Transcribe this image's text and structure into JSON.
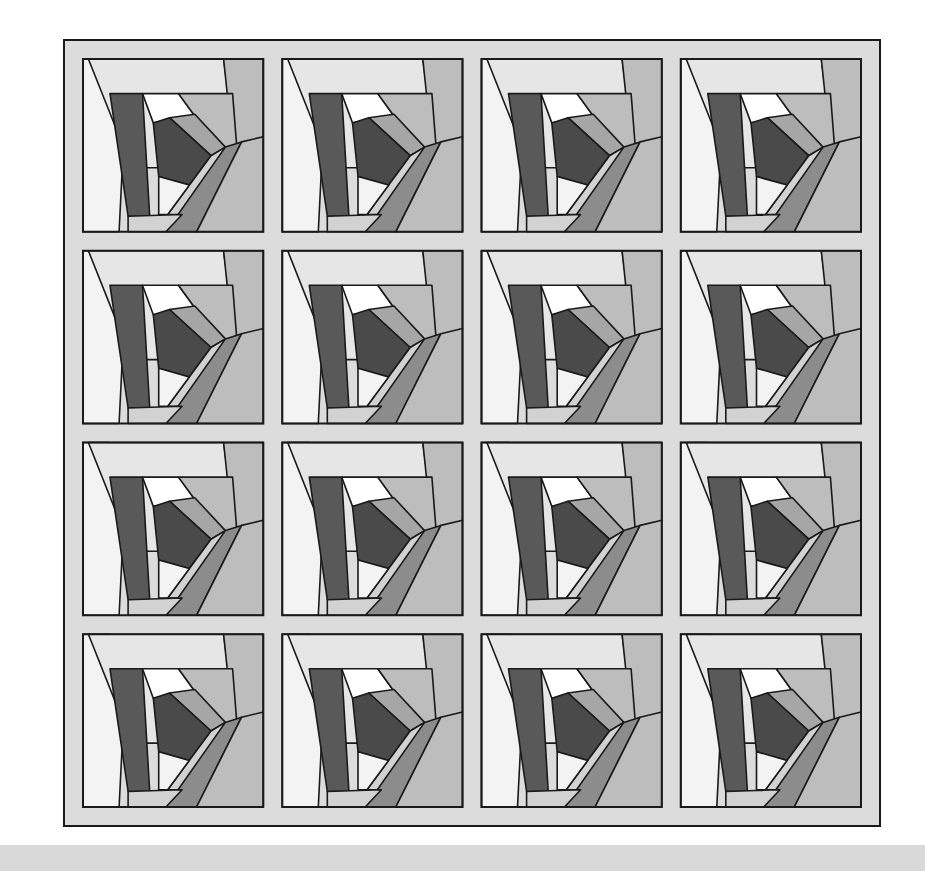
{
  "quilt": {
    "title": "Crazy Log Cabin Quilt",
    "rows": 4,
    "cols": 4,
    "outer": {
      "x": 64,
      "y": 40,
      "w": 816,
      "h": 786
    },
    "sashing_width": 19,
    "colors": {
      "sashing": "#dcdcdc",
      "outline": "#1a1a1a",
      "white": "#ffffff",
      "very_light": "#f3f3f3",
      "light": "#e6e6e6",
      "light_mid": "#d2d2d2",
      "mid": "#bdbdbd",
      "mid_dark": "#a6a6a6",
      "dark_mid": "#8c8c8c",
      "dark": "#595959",
      "darkest": "#4a4a4a",
      "floor": "#d9d9d9"
    }
  }
}
